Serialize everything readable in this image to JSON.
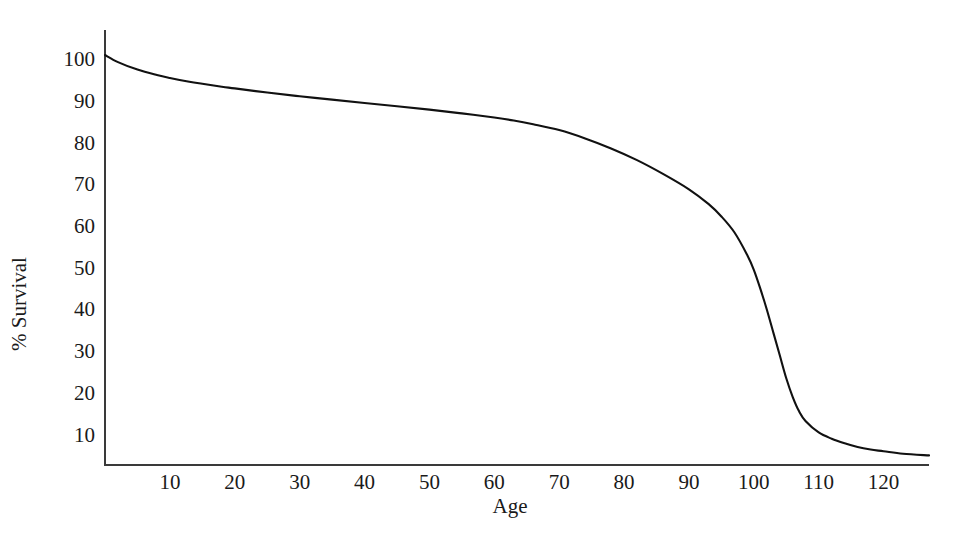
{
  "chart_data": {
    "type": "line",
    "title": "",
    "subtitle": "",
    "xlabel": "Age",
    "ylabel": "% Survival",
    "xlim": [
      0,
      127
    ],
    "ylim": [
      2.7,
      107
    ],
    "grid": false,
    "legend": "none",
    "x_ticks": [
      10,
      20,
      30,
      40,
      50,
      60,
      70,
      80,
      90,
      100,
      110,
      120
    ],
    "y_ticks": [
      10,
      20,
      30,
      40,
      50,
      60,
      70,
      80,
      90,
      100
    ],
    "x_tick_labels": [
      "10",
      "20",
      "30",
      "40",
      "50",
      "60",
      "70",
      "80",
      "90",
      "100",
      "110",
      "120"
    ],
    "y_tick_labels": [
      "10",
      "20",
      "30",
      "40",
      "50",
      "60",
      "70",
      "80",
      "90",
      "100"
    ],
    "line_color": "#111111",
    "axis_color": "#3a3a3a",
    "background_color": "#ffffff",
    "series": [
      {
        "name": "Survival",
        "x": [
          0,
          2,
          5,
          8,
          10,
          13,
          15,
          18,
          20,
          25,
          30,
          35,
          40,
          45,
          50,
          55,
          60,
          63,
          66,
          70,
          74,
          78,
          82,
          86,
          90,
          93,
          95,
          97,
          99,
          100,
          101,
          102,
          103,
          104,
          105,
          106,
          107,
          108,
          110,
          112,
          114,
          116,
          118,
          120,
          123,
          127
        ],
        "y": [
          101,
          99.3,
          97.5,
          96.2,
          95.5,
          94.6,
          94.1,
          93.4,
          93.0,
          92.0,
          91.1,
          90.3,
          89.5,
          88.7,
          87.9,
          87.0,
          86.0,
          85.3,
          84.4,
          83.0,
          81.0,
          78.6,
          75.8,
          72.5,
          68.8,
          65.3,
          62.3,
          58.5,
          53.0,
          49.5,
          45.0,
          40.0,
          34.5,
          29.0,
          23.5,
          19.0,
          15.5,
          13.2,
          10.5,
          9.0,
          7.9,
          7.0,
          6.4,
          6.0,
          5.4,
          5.0
        ]
      }
    ],
    "annotations": []
  },
  "axis": {
    "x_title": "Age",
    "y_title": "% Survival"
  }
}
